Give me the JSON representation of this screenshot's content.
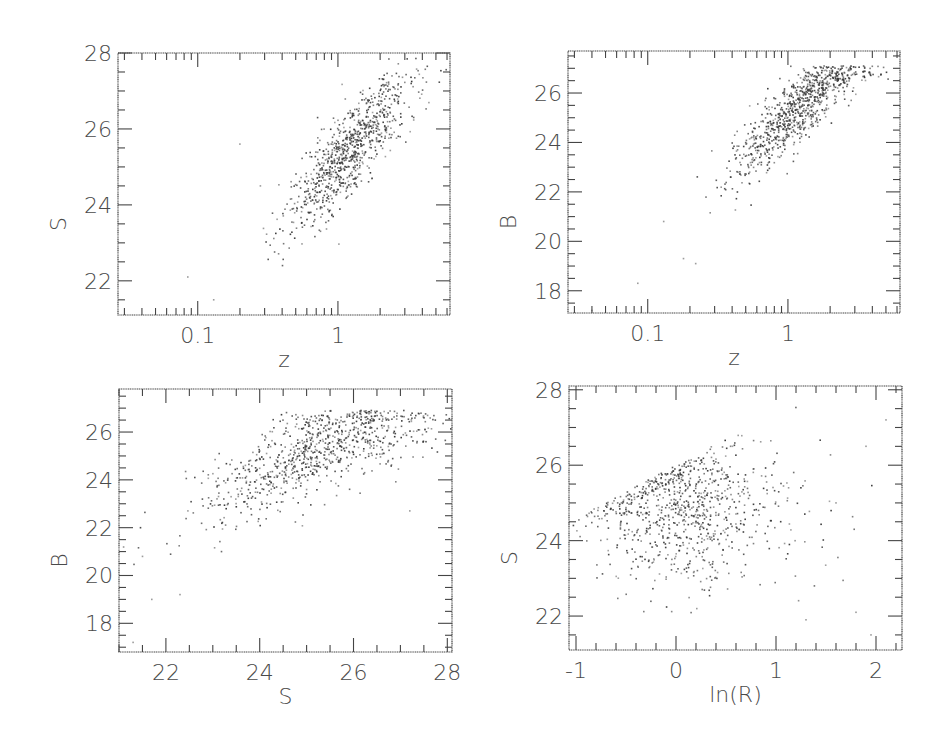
{
  "figure": {
    "ink_color": "#444444",
    "point_color": "#3a3a3a",
    "background": "#ffffff"
  },
  "chart_data": [
    {
      "id": "panel-top-left",
      "type": "scatter",
      "title": "",
      "xlabel": "z",
      "ylabel": "S",
      "xscale": "log",
      "xlim": [
        0.027,
        6.3
      ],
      "ylim": [
        21.1,
        28.0
      ],
      "xticks": [
        0.1,
        1
      ],
      "xtick_labels": [
        "0.1",
        "1"
      ],
      "yticks": [
        22,
        24,
        26,
        28
      ],
      "ytick_labels": [
        "22",
        "24",
        "26",
        "28"
      ],
      "y_minor_step": 0.5,
      "grid": false,
      "legend": null,
      "frame_px": {
        "left": 118,
        "top": 53,
        "right": 450,
        "bottom": 315
      },
      "points_summary": {
        "n": 900,
        "trend": "S increases with log z; dense cluster around z≈1–2, S≈25–26",
        "x_center_log10": 0.12,
        "x_spread_log10": 0.22,
        "relation": "S ≈ 25.1 + 4.0*log10(z)",
        "y_scatter": 0.7,
        "outliers": [
          [
            0.085,
            22.1
          ],
          [
            0.13,
            21.5
          ],
          [
            0.28,
            24.5
          ],
          [
            0.2,
            25.6
          ]
        ]
      }
    },
    {
      "id": "panel-top-right",
      "type": "scatter",
      "title": "",
      "xlabel": "z",
      "ylabel": "B",
      "xscale": "log",
      "xlim": [
        0.027,
        6.3
      ],
      "ylim": [
        17.1,
        27.7
      ],
      "xticks": [
        0.1,
        1
      ],
      "xtick_labels": [
        "0.1",
        "1"
      ],
      "yticks": [
        18,
        20,
        22,
        24,
        26
      ],
      "ytick_labels": [
        "18",
        "20",
        "22",
        "24",
        "26"
      ],
      "y_minor_step": 0.5,
      "grid": false,
      "legend": null,
      "frame_px": {
        "left": 568,
        "top": 51,
        "right": 900,
        "bottom": 313
      },
      "points_summary": {
        "n": 900,
        "trend": "B increases with log z; dense cluster around z≈1–2, B≈25–26.5",
        "x_center_log10": 0.1,
        "x_spread_log10": 0.22,
        "relation": "B ≈ 25.0 + 5.0*log10(z)",
        "y_scatter": 0.9,
        "outliers": [
          [
            0.085,
            18.3
          ],
          [
            0.18,
            19.3
          ],
          [
            0.22,
            19.1
          ],
          [
            0.13,
            20.8
          ],
          [
            0.04,
            17.2
          ]
        ]
      }
    },
    {
      "id": "panel-bottom-left",
      "type": "scatter",
      "title": "",
      "xlabel": "S",
      "ylabel": "B",
      "xscale": "linear",
      "xlim": [
        21.0,
        28.1
      ],
      "ylim": [
        16.8,
        27.8
      ],
      "xticks": [
        22,
        24,
        26,
        28
      ],
      "xtick_labels": [
        "22",
        "24",
        "26",
        "28"
      ],
      "yticks": [
        18,
        20,
        22,
        24,
        26
      ],
      "ytick_labels": [
        "18",
        "20",
        "22",
        "24",
        "26"
      ],
      "x_minor_step": 0.5,
      "y_minor_step": 0.5,
      "grid": false,
      "legend": null,
      "frame_px": {
        "left": 119,
        "top": 389,
        "right": 452,
        "bottom": 652
      },
      "points_summary": {
        "n": 900,
        "trend": "B correlates with S; cloud from (22,21) to (27.5,25.5), densest near S≈25.5, B≈26",
        "x_center": 25.2,
        "x_spread": 1.2,
        "relation": "B ≈ 25.3 + 0.9*(S-25.2) capped near 26.8",
        "y_scatter": 1.0,
        "outliers": [
          [
            21.5,
            20.8
          ],
          [
            22.3,
            19.2
          ],
          [
            21.7,
            19.0
          ],
          [
            21.3,
            17.2
          ],
          [
            27.2,
            22.7
          ]
        ]
      }
    },
    {
      "id": "panel-bottom-right",
      "type": "scatter",
      "title": "",
      "xlabel": "ln(R)",
      "ylabel": "S",
      "xscale": "linear",
      "xlim": [
        -1.07,
        2.26
      ],
      "ylim": [
        21.1,
        28.1
      ],
      "xticks": [
        -1,
        0,
        1,
        2
      ],
      "xtick_labels": [
        "-1",
        "0",
        "1",
        "2"
      ],
      "yticks": [
        22,
        24,
        26,
        28
      ],
      "ytick_labels": [
        "22",
        "24",
        "26",
        "28"
      ],
      "x_minor_step": 0.2,
      "y_minor_step": 0.5,
      "grid": false,
      "legend": null,
      "frame_px": {
        "left": 569,
        "top": 386,
        "right": 902,
        "bottom": 650
      },
      "points_summary": {
        "n": 900,
        "trend": "Broad cloud centered at ln(R)≈0, S≈25; upper envelope rises with ln(R) toward S≈27.5 at ln(R)≈1",
        "x_center": 0.05,
        "x_spread": 0.42,
        "relation": "S upper envelope ≈ 26.0 + 1.4*ln(R)",
        "y_center": 24.9,
        "y_scatter": 1.0,
        "outliers": [
          [
            1.9,
            26.5
          ],
          [
            2.1,
            27.2
          ],
          [
            1.6,
            25.0
          ],
          [
            1.8,
            22.1
          ],
          [
            1.95,
            21.5
          ],
          [
            1.3,
            21.9
          ]
        ]
      }
    }
  ]
}
